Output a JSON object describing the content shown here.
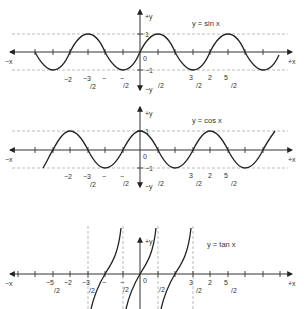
{
  "panels": [
    {
      "id": "sin",
      "title": "y = sin x",
      "function": "sin",
      "axis_labels": {
        "neg_x": "−x",
        "pos_x": "+x",
        "pos_y": "+y",
        "neg_y": "−y",
        "origin": "0"
      },
      "y_ticks": [
        "1",
        "−1"
      ],
      "x_tick_labels": [
        "−2",
        "−3/2",
        "−",
        "−/2",
        "/2",
        "3/2",
        "2",
        "5/2"
      ]
    },
    {
      "id": "cos",
      "title": "y = cos x",
      "function": "cos",
      "axis_labels": {
        "neg_x": "−x",
        "pos_x": "+x",
        "pos_y": "+y",
        "neg_y": "−y",
        "origin": "0"
      },
      "y_ticks": [
        "1",
        "−1"
      ],
      "x_tick_labels": [
        "−2",
        "−3/2",
        "−",
        "−/2",
        "/2",
        "3/2",
        "2",
        "5/2"
      ]
    },
    {
      "id": "tan",
      "title": "y = tan x",
      "function": "tan",
      "axis_labels": {
        "neg_x": "−x",
        "pos_x": "+x",
        "pos_y": "+y",
        "origin": "0"
      },
      "x_tick_labels": [
        "−5/2",
        "−2",
        "−3/2",
        "−",
        "−/2",
        "/2",
        "3/2",
        "2",
        "5/2"
      ]
    }
  ],
  "colors": {
    "curve": "#222222",
    "axis": "#333333",
    "dashed": "#aaaaaa",
    "text": "#333333"
  }
}
